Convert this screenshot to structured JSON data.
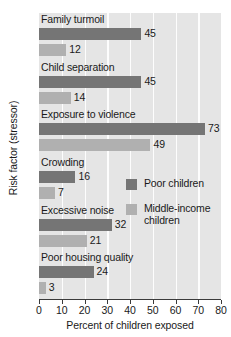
{
  "chart_data": {
    "type": "bar",
    "orientation": "horizontal",
    "title": "",
    "xlabel": "Percent of children exposed",
    "ylabel": "Risk factor (stressor)",
    "xlim": [
      0,
      80
    ],
    "xticks": [
      0,
      10,
      20,
      30,
      40,
      50,
      60,
      70,
      80
    ],
    "grid": true,
    "legend_position": "middle-right-inside",
    "categories": [
      "Family turmoil",
      "Child separation",
      "Exposure to violence",
      "Crowding",
      "Excessive noise",
      "Poor housing quality"
    ],
    "series": [
      {
        "name": "Poor children",
        "color": "#757575",
        "values": [
          45,
          45,
          73,
          16,
          32,
          24
        ]
      },
      {
        "name": "Middle-income children",
        "color": "#b0b0b0",
        "values": [
          12,
          14,
          49,
          7,
          21,
          3
        ]
      }
    ]
  },
  "legend": {
    "items": [
      {
        "label": "Poor children",
        "swatch": "poor"
      },
      {
        "label": "Middle-income\nchildren",
        "swatch": "middle"
      }
    ]
  }
}
